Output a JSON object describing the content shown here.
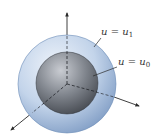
{
  "diagram": {
    "labels": {
      "outer": {
        "var": "u",
        "eq": " = ",
        "rhs": "u",
        "sub": "1"
      },
      "inner": {
        "var": "u",
        "eq": " = ",
        "rhs": "u",
        "sub": "0"
      }
    },
    "colors": {
      "outer_sphere_light": "#e6eef8",
      "outer_sphere_mid": "#b9cde6",
      "outer_sphere_dark": "#7f9cc4",
      "outer_sphere_edge": "#6f8fb8",
      "inner_sphere_light": "#c9ccd2",
      "inner_sphere_mid": "#80858d",
      "inner_sphere_dark": "#3d4148",
      "axis": "#2a2a2a",
      "label": "#333333"
    }
  }
}
